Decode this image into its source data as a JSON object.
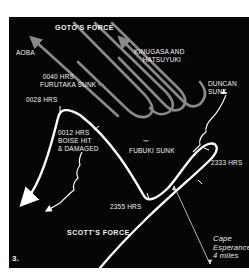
{
  "figure_number": "3.",
  "forces": {
    "japanese": "GOTO'S FORCE",
    "american": "SCOTT'S FORCE"
  },
  "ships": {
    "aoba": "AOBA",
    "kinugasa_line1": "KINUGASA AND",
    "kinugasa_line2": "HATSUYUKI"
  },
  "events": {
    "furutaka_time": "0040 HRS",
    "furutaka_text": "FURUTAKA SUNK",
    "turn_0028": "0028 HRS",
    "boise_time": "0012 HRS",
    "boise_line2": "BOISE HIT",
    "boise_line3": "& DAMAGED",
    "fubuki": "FUBUKI SUNK",
    "duncan_line1": "DUNCAN",
    "duncan_line2": "SUNK",
    "time_2333": "2333 HRS",
    "time_2355": "2355 HRS"
  },
  "scale_note": {
    "line1": "Cape",
    "line2": "Esperance",
    "line3": "4 miles"
  },
  "colors": {
    "background": "#050505",
    "us_track": "#ffffff",
    "japanese_track": "#8a8a8a",
    "text": "#f2f2f2"
  }
}
